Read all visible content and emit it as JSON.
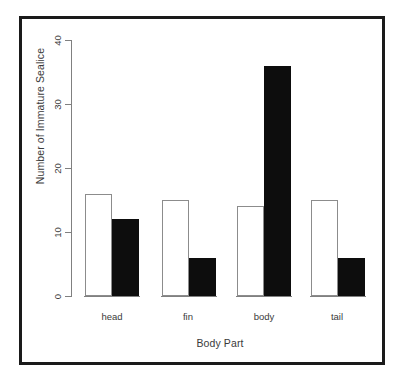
{
  "chart_data": {
    "type": "bar",
    "title": "",
    "subtitle": "",
    "xlabel": "Body Part",
    "ylabel": "Number of Immature Sealice",
    "categories": [
      "head",
      "fin",
      "body",
      "tail"
    ],
    "series": [
      {
        "name": "open",
        "fill": "#ffffff",
        "values": [
          16,
          15,
          14,
          15
        ]
      },
      {
        "name": "filled",
        "fill": "#0d0d0d",
        "values": [
          12,
          6,
          36,
          6
        ]
      }
    ],
    "ylim": [
      0,
      40
    ],
    "yticks": [
      0,
      10,
      20,
      30,
      40
    ],
    "ytick_labels": [
      "0",
      "10",
      "20",
      "30",
      "40"
    ],
    "grid": false,
    "legend": false,
    "legend_position": "none",
    "annotations": []
  },
  "figure": {
    "frame_color": "#1a1a1a",
    "background": "#ffffff",
    "axis_color": "#808080",
    "text_color": "#3a3a3a"
  }
}
